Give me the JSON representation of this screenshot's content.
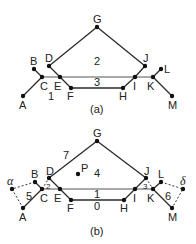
{
  "diagram": {
    "a": {
      "caption": "(a)",
      "vertices": {
        "A": "A",
        "B": "B",
        "C": "C",
        "D": "D",
        "E": "E",
        "F": "F",
        "G": "G",
        "H": "H",
        "I": "I",
        "J": "J",
        "K": "K",
        "L": "L",
        "M": "M"
      },
      "faces": {
        "f1": "1",
        "f2": "2",
        "f3": "3"
      }
    },
    "b": {
      "caption": "(b)",
      "vertices": {
        "A": "A",
        "B": "B",
        "C": "C",
        "D": "D",
        "E": "E",
        "F": "F",
        "G": "G",
        "H": "H",
        "I": "I",
        "J": "J",
        "K": "K",
        "L": "L",
        "M": "M",
        "P": "P",
        "alpha": "α",
        "delta": "δ"
      },
      "faces": {
        "f0": "0",
        "f1": "1",
        "f2": "2",
        "f3": "3",
        "f4": "4",
        "f5": "5",
        "f6": "6",
        "f7": "7"
      }
    }
  }
}
